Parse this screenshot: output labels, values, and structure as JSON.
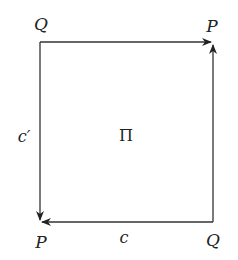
{
  "diagram": {
    "type": "commutative-square",
    "colors": {
      "stroke": "#333333",
      "text": "#222222",
      "background": "#ffffff"
    },
    "corners": {
      "top_left": {
        "label": "Q",
        "x": 40,
        "y": 42
      },
      "top_right": {
        "label": "P",
        "x": 213,
        "y": 42
      },
      "bottom_left": {
        "label": "P",
        "x": 40,
        "y": 222
      },
      "bottom_right": {
        "label": "Q",
        "x": 213,
        "y": 222
      }
    },
    "edges": [
      {
        "from": "top_left",
        "to": "top_right",
        "label": ""
      },
      {
        "from": "bottom_right",
        "to": "top_right",
        "label": ""
      },
      {
        "from": "bottom_right",
        "to": "bottom_left",
        "label": "c"
      },
      {
        "from": "top_left",
        "to": "bottom_left",
        "label": "c′"
      }
    ],
    "labels": {
      "top_left": "Q",
      "top_right": "P",
      "bottom_left": "P",
      "bottom_right": "Q",
      "left_edge": "c′",
      "bottom_edge": "c",
      "center": "Π"
    }
  }
}
